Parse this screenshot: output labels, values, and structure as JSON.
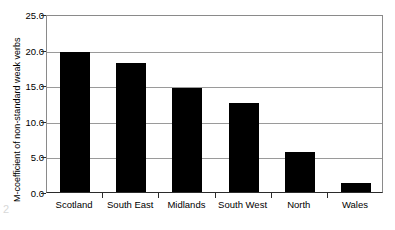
{
  "chart_data": {
    "type": "bar",
    "title": "",
    "subtitle": "",
    "xlabel": "",
    "ylabel": "M-coefficient of non-standard weak verbs",
    "categories": [
      "Scotland",
      "South East",
      "Midlands",
      "South West",
      "North",
      "Wales"
    ],
    "values": [
      19.7,
      18.1,
      14.6,
      12.5,
      5.6,
      1.2
    ],
    "ylim": [
      0.0,
      25.0
    ],
    "ytick_values": [
      0.0,
      5.0,
      10.0,
      15.0,
      20.0,
      25.0
    ],
    "ytick_labels": [
      "0.0",
      "5.0",
      "10.0",
      "15.0",
      "20.0",
      "25.0"
    ],
    "grid": true,
    "legend": false,
    "legend_position": "none",
    "bar_color": "#000000",
    "plot_background": "#ffffff",
    "axis_color": "#2b2b2b",
    "gridline_color": "#9a9a9a"
  },
  "artifact": {
    "mark": "2"
  }
}
